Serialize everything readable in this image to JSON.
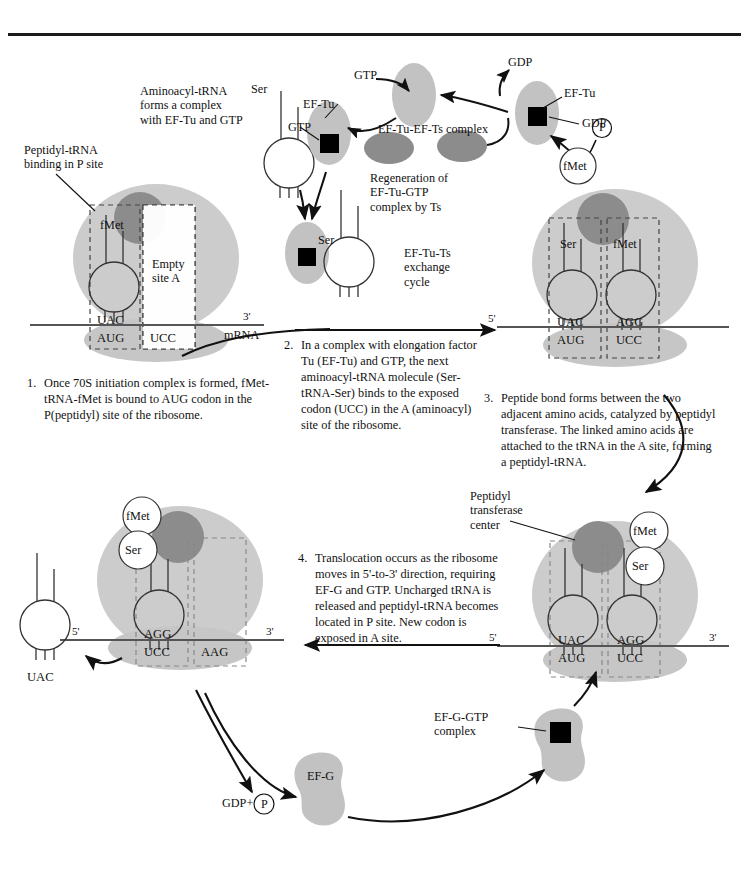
{
  "figure": {
    "type": "process-diagram"
  },
  "colors": {
    "ribosome_large": "#cccccc",
    "ribosome_small": "#c4c4c4",
    "peptidyl_center": "#8a8a8a",
    "factor_light": "#c2c2c2",
    "factor_dark": "#8c8c8c",
    "nucleotide_square": "#000000",
    "line": "#1a1a1a",
    "mrna_line": "#555555",
    "dashed_site": "#444444"
  },
  "annotations": {
    "peptidyl_trna_binding": "Peptidyl-tRNA\nbinding in P site",
    "aminoacyl_complex": "Aminoacyl-tRNA\nforms a complex\nwith EF-Tu and GTP",
    "ef_tu_ef_ts_complex": "EF-Tu-EF-Ts complex",
    "regeneration": "Regeneration of\nEF-Tu-GTP\ncomplex by Ts",
    "exchange_cycle": "EF-Tu-Ts\nexchange\ncycle",
    "peptidyl_transferase_center": "Peptidyl\ntransferase\ncenter",
    "ef_g_gtp_complex": "EF-G-GTP\ncomplex"
  },
  "labels": {
    "ser": "Ser",
    "fmet": "fMet",
    "gtp": "GTP",
    "gdp": "GDP",
    "ef_tu": "EF-Tu",
    "ef_g": "EF-G",
    "p_circle": "P",
    "gdp_plus_p": "GDP+",
    "mrna": "mRNA",
    "empty_site_a": "Empty\nsite A",
    "five_prime": "5'",
    "three_prime": "3'",
    "uac": "UAC",
    "aug": "AUG",
    "ucc": "UCC",
    "agg": "AGG",
    "aag": "AAG"
  },
  "steps": [
    {
      "number": "1.",
      "text": "Once 70S initiation complex is formed,\nfMet-tRNA-fMet is bound to AUG codon\nin the P(peptidyl) site of the ribosome."
    },
    {
      "number": "2.",
      "text": "In a complex with elongation\nfactor Tu (EF-Tu) and GTP,\nthe next aminoacyl-tRNA\nmolecule (Ser-tRNA-Ser)\nbinds to the exposed\ncodon (UCC) in the A\n(aminoacyl) site of the ribosome."
    },
    {
      "number": "3.",
      "text": "Peptide bond forms between\nthe two adjacent amino acids,\ncatalyzed by peptidyl\ntransferase.  The linked\namino acids are attached\nto the tRNA in the A site,\nforming a peptidyl-tRNA."
    },
    {
      "number": "4.",
      "text": "Translocation occurs as the\nribosome moves in 5'-to-3' direction,\nrequiring EF-G and GTP.\nUncharged tRNA is released\nand peptidyl-tRNA becomes\nlocated in P site.  New\ncodon is exposed in A site."
    }
  ],
  "ribosomes": [
    {
      "id": "ribosome-1",
      "p_site": {
        "amino_acid": "fMet",
        "anticodon": "UAC",
        "codon": "AUG"
      },
      "a_site": {
        "amino_acid": "",
        "anticodon": "",
        "codon": "UCC",
        "note": "Empty\nsite A"
      },
      "mrna_ends": {
        "left": "",
        "right": "3'"
      }
    },
    {
      "id": "ribosome-2",
      "p_site": {
        "amino_acid": "Ser",
        "anticodon": "UAC",
        "codon": "AUG"
      },
      "a_site": {
        "amino_acid": "fMet",
        "anticodon": "AGG",
        "codon": "UCC"
      },
      "mrna_ends": {
        "left": "5'",
        "right": ""
      }
    },
    {
      "id": "ribosome-3",
      "p_site": {
        "amino_acid": "",
        "anticodon": "UAC",
        "codon": "AUG"
      },
      "a_site": {
        "amino_acid_top": "fMet",
        "amino_acid_bottom": "Ser",
        "anticodon": "AGG",
        "codon": "UCC"
      },
      "mrna_ends": {
        "left": "5'",
        "right": "3'"
      }
    },
    {
      "id": "ribosome-4",
      "p_site": {
        "amino_acid_top": "fMet",
        "amino_acid_bottom": "Ser",
        "anticodon": "AGG",
        "codon": "UCC"
      },
      "a_site": {
        "codon": "AAG"
      },
      "released_trna": {
        "anticodon": "UAC"
      },
      "mrna_ends": {
        "left": "5'",
        "right": "3'"
      }
    }
  ]
}
